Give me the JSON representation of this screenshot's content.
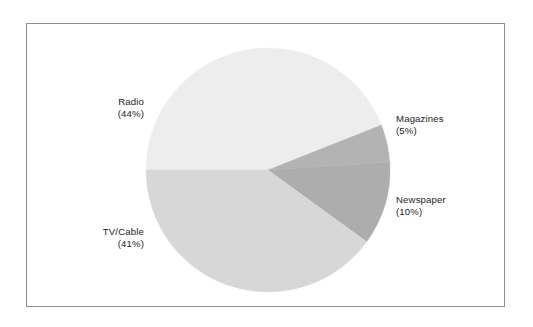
{
  "figure": {
    "background_color": "#ffffff",
    "frame_color": "#8e8e8e",
    "has_frame": true
  },
  "chart_data": {
    "type": "pie",
    "title": "",
    "subtitle": "",
    "xlabel": "",
    "ylabel": "",
    "legend_position": "none",
    "grid": false,
    "labels_outside": true,
    "start_angle_deg": 180,
    "direction": "clockwise",
    "center": {
      "x": 268,
      "y": 170
    },
    "radius": 122,
    "categories": [
      "Radio",
      "Magazines",
      "Newspaper",
      "TV/Cable"
    ],
    "values": [
      44,
      5,
      10,
      41
    ],
    "units": "%",
    "slices": [
      {
        "name": "Radio",
        "value": 44,
        "percent_text": "(44%)",
        "color": "#ededed",
        "start_angle_deg": 180,
        "end_angle_deg": 338.4,
        "label_align": "right"
      },
      {
        "name": "Magazines",
        "value": 5,
        "percent_text": "(5%)",
        "color": "#b3b3b3",
        "start_angle_deg": 338.4,
        "end_angle_deg": 356.4,
        "label_align": "left"
      },
      {
        "name": "Newspaper",
        "value": 10,
        "percent_text": "(10%)",
        "color": "#adadad",
        "start_angle_deg": 356.4,
        "end_angle_deg": 36.0,
        "label_align": "left"
      },
      {
        "name": "TV/Cable",
        "value": 41,
        "percent_text": "(41%)",
        "color": "#d7d7d7",
        "start_angle_deg": 36.0,
        "end_angle_deg": 180,
        "label_align": "right"
      }
    ]
  },
  "labels": {
    "radio": {
      "name": "Radio",
      "percent": "(44%)"
    },
    "magazines": {
      "name": "Magazines",
      "percent": "(5%)"
    },
    "newspaper": {
      "name": "Newspaper",
      "percent": "(10%)"
    },
    "tvcable": {
      "name": "TV/Cable",
      "percent": "(41%)"
    }
  }
}
